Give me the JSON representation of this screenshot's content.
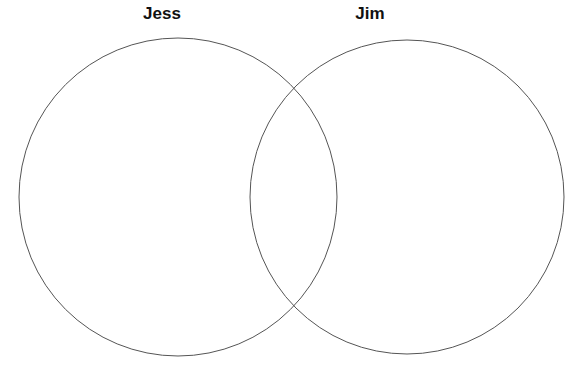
{
  "diagram": {
    "type": "venn",
    "sets": [
      {
        "label": "Jess",
        "cx": 178,
        "cy": 197,
        "r": 159
      },
      {
        "label": "Jim",
        "cx": 407,
        "cy": 197,
        "r": 157
      }
    ],
    "stroke_color": "#555555"
  }
}
